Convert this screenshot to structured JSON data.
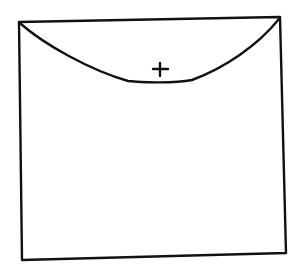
{
  "diagram": {
    "type": "hand-drawn sketch",
    "stroke_color": "#111111",
    "background_color": "#ffffff",
    "elements": [
      {
        "name": "square-outline",
        "corners": [
          [
            19,
            22
          ],
          [
            280,
            17
          ],
          [
            286,
            253
          ],
          [
            22,
            260
          ]
        ]
      },
      {
        "name": "bottom-arc",
        "from": [
          19,
          22
        ],
        "to": [
          280,
          17
        ],
        "lowest_y": 82
      },
      {
        "name": "plus-sign",
        "center": [
          160,
          70
        ],
        "glyph": "+"
      }
    ]
  }
}
